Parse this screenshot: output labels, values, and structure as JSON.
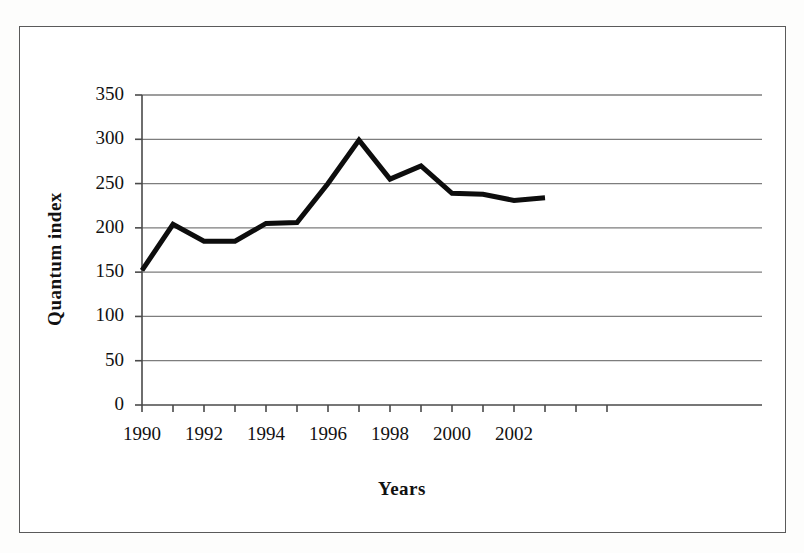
{
  "chart_data": {
    "type": "line",
    "title": "",
    "xlabel": "Years",
    "ylabel": "Quantum index",
    "x": [
      1990,
      1991,
      1992,
      1993,
      1994,
      1995,
      1996,
      1997,
      1998,
      1999,
      2000,
      2001,
      2002,
      2003
    ],
    "values": [
      152,
      204,
      185,
      185,
      205,
      206,
      250,
      299,
      255,
      270,
      239,
      238,
      231,
      234
    ],
    "series": [
      {
        "name": "Quantum index",
        "values": [
          152,
          204,
          185,
          185,
          205,
          206,
          250,
          299,
          255,
          270,
          239,
          238,
          231,
          234
        ]
      }
    ],
    "xlim": [
      1989,
      2005
    ],
    "ylim": [
      0,
      350
    ],
    "y_ticks": [
      0,
      50,
      100,
      150,
      200,
      250,
      300,
      350
    ],
    "y_tick_labels": [
      "0",
      "50",
      "100",
      "150",
      "200",
      "250",
      "300",
      "350"
    ],
    "x_ticks": [
      1990,
      1991,
      1992,
      1993,
      1994,
      1995,
      1996,
      1997,
      1998,
      1999,
      2000,
      2001,
      2002,
      2003,
      2004,
      2005
    ],
    "x_tick_labels": [
      "1990",
      "",
      "1992",
      "",
      "1994",
      "",
      "1996",
      "",
      "1998",
      "",
      "2000",
      "",
      "2002",
      "",
      "",
      ""
    ],
    "x_labeled_ticks": [
      {
        "value": 1990,
        "label": "1990"
      },
      {
        "value": 1992,
        "label": "1992"
      },
      {
        "value": 1994,
        "label": "1994"
      },
      {
        "value": 1996,
        "label": "1996"
      },
      {
        "value": 1998,
        "label": "1998"
      },
      {
        "value": 2000,
        "label": "2000"
      },
      {
        "value": 2002,
        "label": "2002"
      }
    ],
    "grid": "horizontal",
    "legend": "none",
    "line_color": "#0d0d0d",
    "grid_color": "#7d7d7d",
    "axis_color": "#4a4a4a",
    "line_width": 5
  },
  "figure": {
    "border_color": "#5a5a5a",
    "background": "#ffffff"
  }
}
